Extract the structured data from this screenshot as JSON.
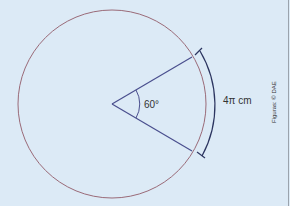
{
  "figure": {
    "angle_label": "60°",
    "arc_label": "4π cm",
    "credit": "Figuras: © DAE",
    "colors": {
      "background": "#dceaf6",
      "circle": "#9a6a78",
      "rays": "#4a4f8e",
      "bracket": "#2c3560",
      "border": "#9aa3ad"
    }
  }
}
